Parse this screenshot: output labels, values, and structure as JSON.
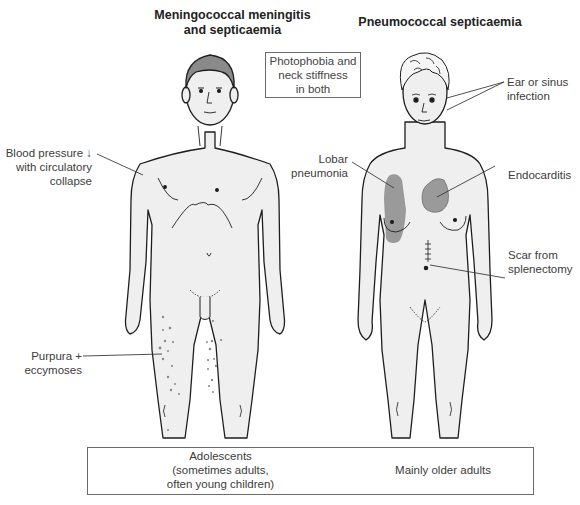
{
  "titles": {
    "left": "Meningococcal meningitis and septicaemia",
    "left_line1": "Meningococcal meningitis",
    "left_line2": "and septicaemia",
    "right": "Pneumococcal septicaemia"
  },
  "center_box": {
    "line1": "Photophobia and",
    "line2": "neck stiffness",
    "line3": "in both"
  },
  "left_labels": {
    "blood_pressure": {
      "line1": "Blood pressure ↓",
      "line2": "with circulatory",
      "line3": "collapse"
    },
    "purpura": {
      "line1": "Purpura +",
      "line2": "eccymoses"
    }
  },
  "right_labels": {
    "ear": {
      "line1": "Ear or sinus",
      "line2": "infection"
    },
    "lobar": {
      "line1": "Lobar",
      "line2": "pneumonia"
    },
    "endocarditis": {
      "line1": "Endocarditis"
    },
    "scar": {
      "line1": "Scar from",
      "line2": "splenectomy"
    }
  },
  "bottom_box": {
    "left": {
      "line1": "Adolescents",
      "line2": "(sometimes adults,",
      "line3": "often young children)"
    },
    "right": "Mainly older adults"
  },
  "colors": {
    "skin": "#efefef",
    "outline": "#1e1e1e",
    "hair_male": "#8a8a8a",
    "lesion": "#9a9a9a",
    "purpura_dots": "#888888"
  }
}
